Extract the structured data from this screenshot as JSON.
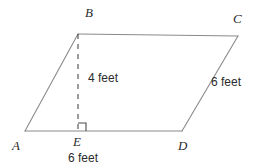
{
  "figure": {
    "kind": "geometry-diagram",
    "shape": "parallelogram",
    "background_color": "#ffffff",
    "stroke_color": "#8a8a8a",
    "text_color": "#2b2b2b",
    "width": 259,
    "height": 168
  },
  "vertices": [
    {
      "id": "A",
      "label": "A",
      "x": 25,
      "y": 131,
      "label_x": 12,
      "label_y": 139
    },
    {
      "id": "B",
      "label": "B",
      "x": 78,
      "y": 34,
      "label_x": 85,
      "label_y": 6
    },
    {
      "id": "C",
      "label": "C",
      "x": 238,
      "y": 36,
      "label_x": 233,
      "label_y": 12
    },
    {
      "id": "D",
      "label": "D",
      "x": 182,
      "y": 131,
      "label_x": 178,
      "label_y": 139
    },
    {
      "id": "E",
      "label": "E",
      "x": 78,
      "y": 131,
      "label_x": 73,
      "label_y": 135
    }
  ],
  "edges": [
    {
      "name": "side-AB",
      "from": "A",
      "to": "B",
      "style": "solid"
    },
    {
      "name": "side-BC",
      "from": "B",
      "to": "C",
      "style": "solid"
    },
    {
      "name": "side-CD",
      "from": "C",
      "to": "D",
      "style": "solid"
    },
    {
      "name": "side-DA",
      "from": "D",
      "to": "A",
      "style": "solid"
    },
    {
      "name": "altitude-BE",
      "from": "B",
      "to": "E",
      "style": "dashed"
    }
  ],
  "measurements": {
    "height": {
      "value": "4 feet",
      "x": 88,
      "y": 72,
      "applies_to": "altitude-BE"
    },
    "side_right": {
      "value": "6 feet",
      "x": 211,
      "y": 76,
      "applies_to": "side-CD"
    },
    "base_bottom": {
      "value": "6 feet",
      "x": 68,
      "y": 152,
      "applies_to": "side-DA"
    }
  },
  "right_angle": {
    "name": "right-angle-at-E",
    "vertex": "E",
    "size": 8,
    "x": 78,
    "y": 131
  }
}
